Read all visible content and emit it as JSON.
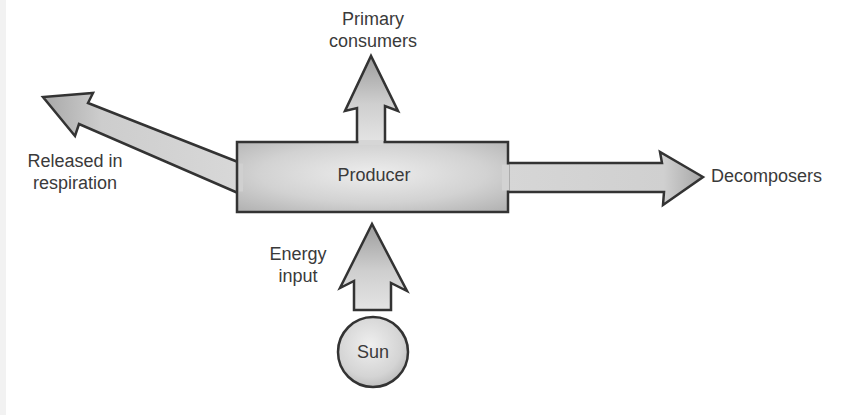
{
  "diagram": {
    "nodes": {
      "producer": {
        "label": "Producer"
      },
      "sun": {
        "label": "Sun"
      }
    },
    "labels": {
      "primary_consumers_line1": "Primary",
      "primary_consumers_line2": "consumers",
      "released_line1": "Released in",
      "released_line2": "respiration",
      "decomposers": "Decomposers",
      "energy_line1": "Energy",
      "energy_line2": "input"
    },
    "edges": [
      {
        "from": "Sun",
        "to": "Producer",
        "label": "Energy input"
      },
      {
        "from": "Producer",
        "to": "Primary consumers"
      },
      {
        "from": "Producer",
        "to": "Released in respiration"
      },
      {
        "from": "Producer",
        "to": "Decomposers"
      }
    ],
    "colors": {
      "stroke": "#333333",
      "fill_light": "#e6e6e6",
      "fill_dark": "#a9a9a9",
      "text": "#3a3a3a"
    }
  }
}
